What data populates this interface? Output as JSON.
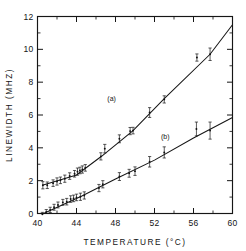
{
  "chart_data": {
    "type": "scatter",
    "title": "",
    "xlabel": "TEMPERATURE (°C)",
    "ylabel": "LINEWIDTH (MHZ)",
    "xlim": [
      40,
      60
    ],
    "ylim": [
      0,
      12
    ],
    "xticks": [
      40,
      44,
      48,
      52,
      56,
      60
    ],
    "xticklabels": [
      "40",
      "44",
      "48",
      "52",
      "56",
      "60"
    ],
    "xminorticks": [
      42,
      46,
      50,
      54,
      58
    ],
    "yticks": [
      0,
      2,
      4,
      6,
      8,
      10,
      12
    ],
    "yticklabels": [
      "0",
      "2",
      "4",
      "6",
      "8",
      "10",
      "12"
    ],
    "yminorticks": [
      1,
      3,
      5,
      7,
      9,
      11
    ],
    "grid": false,
    "legend_position": "inline-annotations",
    "annotations": [
      {
        "text": "(a)",
        "x": 47.6,
        "y": 6.85
      },
      {
        "text": "(b)",
        "x": 53.1,
        "y": 4.55
      }
    ],
    "series": [
      {
        "name": "(a)",
        "label": "(a)",
        "marker": "point-with-error-bars",
        "fit": {
          "type": "line-segments",
          "points": [
            [
              40.5,
              1.72
            ],
            [
              44.0,
              2.35
            ],
            [
              46.6,
              3.5
            ],
            [
              49.8,
              5.05
            ],
            [
              53.0,
              7.0
            ],
            [
              57.7,
              9.7
            ],
            [
              60.0,
              11.5
            ]
          ]
        },
        "points": [
          {
            "x": 40.55,
            "y": 1.72,
            "yerr": 0.22
          },
          {
            "x": 41.0,
            "y": 1.72,
            "yerr": 0.2
          },
          {
            "x": 41.6,
            "y": 1.85,
            "yerr": 0.2
          },
          {
            "x": 42.0,
            "y": 1.95,
            "yerr": 0.22
          },
          {
            "x": 42.35,
            "y": 2.02,
            "yerr": 0.2
          },
          {
            "x": 42.8,
            "y": 2.12,
            "yerr": 0.22
          },
          {
            "x": 43.3,
            "y": 2.28,
            "yerr": 0.2
          },
          {
            "x": 43.8,
            "y": 2.42,
            "yerr": 0.2
          },
          {
            "x": 44.1,
            "y": 2.55,
            "yerr": 0.22
          },
          {
            "x": 44.35,
            "y": 2.62,
            "yerr": 0.2
          },
          {
            "x": 44.6,
            "y": 2.68,
            "yerr": 0.22
          },
          {
            "x": 44.9,
            "y": 2.78,
            "yerr": 0.2
          },
          {
            "x": 46.5,
            "y": 3.48,
            "yerr": 0.22
          },
          {
            "x": 46.9,
            "y": 3.95,
            "yerr": 0.26
          },
          {
            "x": 48.4,
            "y": 4.55,
            "yerr": 0.24
          },
          {
            "x": 49.5,
            "y": 5.02,
            "yerr": 0.22
          },
          {
            "x": 49.8,
            "y": 5.05,
            "yerr": 0.2
          },
          {
            "x": 51.5,
            "y": 6.15,
            "yerr": 0.3
          },
          {
            "x": 53.0,
            "y": 6.95,
            "yerr": 0.22
          },
          {
            "x": 56.35,
            "y": 9.5,
            "yerr": 0.22
          },
          {
            "x": 57.7,
            "y": 9.7,
            "yerr": 0.38
          }
        ]
      },
      {
        "name": "(b)",
        "label": "(b)",
        "marker": "point-with-error-bars",
        "fit": {
          "type": "line-segments",
          "points": [
            [
              40.45,
              -0.05
            ],
            [
              44.5,
              1.05
            ],
            [
              48.0,
              2.1
            ],
            [
              52.0,
              3.25
            ],
            [
              56.0,
              4.6
            ],
            [
              60.0,
              5.85
            ]
          ]
        },
        "points": [
          {
            "x": 40.5,
            "y": -0.05,
            "yerr": 0.12
          },
          {
            "x": 40.9,
            "y": 0.1,
            "yerr": 0.14
          },
          {
            "x": 41.3,
            "y": 0.22,
            "yerr": 0.16
          },
          {
            "x": 41.7,
            "y": 0.38,
            "yerr": 0.18
          },
          {
            "x": 42.1,
            "y": 0.52,
            "yerr": 0.18
          },
          {
            "x": 42.6,
            "y": 0.68,
            "yerr": 0.18
          },
          {
            "x": 43.0,
            "y": 0.72,
            "yerr": 0.2
          },
          {
            "x": 43.4,
            "y": 0.88,
            "yerr": 0.2
          },
          {
            "x": 43.7,
            "y": 0.92,
            "yerr": 0.2
          },
          {
            "x": 44.0,
            "y": 0.98,
            "yerr": 0.2
          },
          {
            "x": 44.4,
            "y": 1.02,
            "yerr": 0.22
          },
          {
            "x": 44.8,
            "y": 1.1,
            "yerr": 0.22
          },
          {
            "x": 46.3,
            "y": 1.55,
            "yerr": 0.22
          },
          {
            "x": 46.7,
            "y": 1.78,
            "yerr": 0.22
          },
          {
            "x": 48.4,
            "y": 2.25,
            "yerr": 0.24
          },
          {
            "x": 49.4,
            "y": 2.45,
            "yerr": 0.24
          },
          {
            "x": 50.0,
            "y": 2.58,
            "yerr": 0.26
          },
          {
            "x": 51.5,
            "y": 3.15,
            "yerr": 0.32
          },
          {
            "x": 53.0,
            "y": 3.72,
            "yerr": 0.34
          },
          {
            "x": 56.3,
            "y": 5.15,
            "yerr": 0.42
          },
          {
            "x": 57.7,
            "y": 5.05,
            "yerr": 0.52
          }
        ]
      }
    ]
  }
}
